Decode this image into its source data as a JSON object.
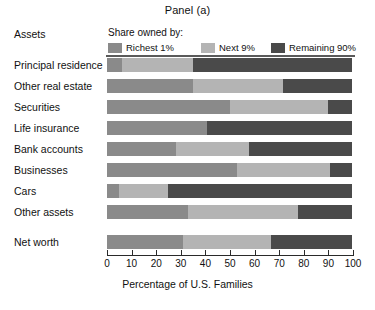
{
  "title": "Panel (a)",
  "assets_heading": "Assets",
  "legend": {
    "title": "Share owned by:",
    "entries": [
      {
        "label": "Richest 1%",
        "color": "#8a8a8a"
      },
      {
        "label": "Next 9%",
        "color": "#b4b4b4"
      },
      {
        "label": "Remaining 90%",
        "color": "#4a4a4a"
      }
    ]
  },
  "axis": {
    "xlabel": "Percentage of U.S. Families",
    "ticks": [
      0,
      10,
      20,
      30,
      40,
      50,
      60,
      70,
      80,
      90,
      100
    ]
  },
  "chart_data": {
    "type": "bar",
    "orientation": "horizontal",
    "stacked": true,
    "title": "Panel (a)",
    "xlabel": "Percentage of U.S. Families",
    "ylabel": "Assets",
    "xlim": [
      0,
      100
    ],
    "grid": false,
    "legend_position": "top",
    "legend_title": "Share owned by:",
    "categories": [
      "Principal residence",
      "Other real estate",
      "Securities",
      "Life insurance",
      "Bank accounts",
      "Businesses",
      "Cars",
      "Other assets",
      "Net worth"
    ],
    "series": [
      {
        "name": "Richest 1%",
        "color": "#8a8a8a",
        "values": [
          6,
          35,
          50,
          41,
          28,
          53,
          5,
          33,
          31
        ]
      },
      {
        "name": "Next 9%",
        "color": "#b4b4b4",
        "values": [
          29,
          37,
          40,
          0,
          30,
          38,
          20,
          45,
          36
        ]
      },
      {
        "name": "Remaining 90%",
        "color": "#4a4a4a",
        "values": [
          65,
          28,
          10,
          59,
          42,
          9,
          75,
          22,
          33
        ]
      }
    ]
  }
}
